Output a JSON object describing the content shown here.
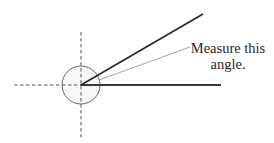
{
  "diagram": {
    "annotation": {
      "line1": "Measure this",
      "line2": "angle."
    },
    "elements": {
      "vertex": "angle-vertex",
      "reference_circle": "protractor-circle",
      "axes": [
        "horizontal-reference-axis",
        "vertical-reference-axis"
      ],
      "rays": [
        "upper-ray",
        "baseline-ray"
      ],
      "leader": "annotation-leader-line"
    },
    "colors": {
      "ray": "#2b2b2b",
      "baseline": "#3a3a3a",
      "circle": "#555555",
      "circle_fill": "#f7f7f7",
      "dashed_axis": "#444444",
      "leader": "#9a9a9a",
      "text": "#2a2a2a"
    }
  }
}
